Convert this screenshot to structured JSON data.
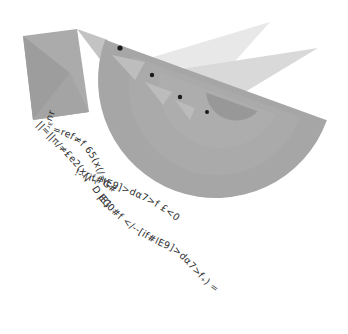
{
  "illustration": {
    "subject": "envelope with nested semicircle birds flying, trailing code text",
    "colors": {
      "background": "#ffffff",
      "envelope_body": "#a9a9a9",
      "envelope_flap": "#9c9c9c",
      "beak_light": "#c4c4c4",
      "bird_outer": "#a6a6a6",
      "bird_ring_2": "#ababab",
      "bird_ring_3": "#b0b0b0",
      "bird_inner": "#979797",
      "wing_back": "#e6e6e6",
      "wing_front": "#d6d6d6",
      "eye": "#1a1a1a",
      "text": "#2e2e2e"
    },
    "code_lines": {
      "line1": "=ref≠f 65(x(/=G#",
      "line2": "!--[if#IE9]>dα7>f £<00---",
      "line3": "||=||π/≠£e2(x(|^D EG",
      "line4": "|E]0#f </--[if#IE9]>dα7>f₊) =ref",
      "short": "ɹu³ʳ"
    }
  }
}
